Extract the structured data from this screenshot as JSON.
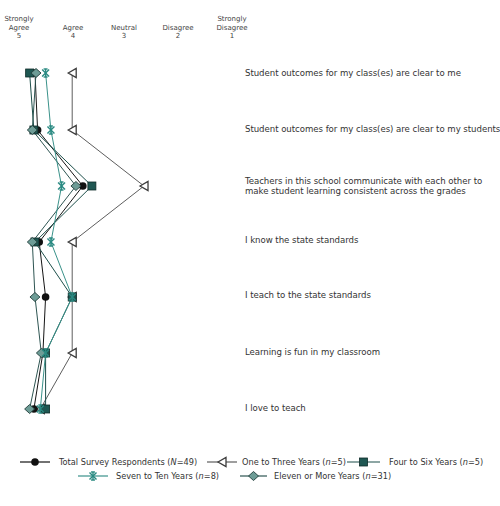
{
  "chart_data": {
    "type": "line",
    "orientation": "vertical profile (categories on rows, scale on x-axis)",
    "title": "",
    "xlabel": "",
    "ylabel": "",
    "xlim": [
      5,
      1
    ],
    "grid": false,
    "legend_position": "bottom",
    "scale_ticks": [
      {
        "value": 5,
        "label": "Strongly Agree"
      },
      {
        "value": 4,
        "label": "Agree"
      },
      {
        "value": 3,
        "label": "Neutral"
      },
      {
        "value": 2,
        "label": "Disagree"
      },
      {
        "value": 1,
        "label": "Strongly Disagree"
      }
    ],
    "categories": [
      "Student outcomes for my class(es) are clear to me",
      "Student outcomes for my class(es) are clear to my students",
      "Teachers in this school communicate with each other to make student learning consistent across the grades",
      "I know the state standards",
      "I teach to the state standards",
      "Learning is fun in my classroom",
      "I love to teach"
    ],
    "series": [
      {
        "name": "One to Three Years (n=5)",
        "marker": "triangle",
        "color": "#5a5a5a",
        "values": [
          4.0,
          4.0,
          2.65,
          4.0,
          4.0,
          4.0,
          4.6
        ]
      },
      {
        "name": "Total Survey Respondents (N=49)",
        "marker": "circle",
        "color": "#111111",
        "values": [
          4.7,
          4.65,
          3.8,
          4.62,
          4.5,
          4.55,
          4.72
        ]
      },
      {
        "name": "Four to Six Years (n=5)",
        "marker": "square",
        "color": "#1d524d",
        "values": [
          4.8,
          4.72,
          3.63,
          4.7,
          4.0,
          4.5,
          4.5
        ]
      },
      {
        "name": "Eleven or More Years (n=31)",
        "marker": "diamond",
        "color": "#2d5a56",
        "values": [
          4.68,
          4.75,
          3.93,
          4.75,
          4.7,
          4.58,
          4.8
        ]
      },
      {
        "name": "Seven to Ten Years (n=8)",
        "marker": "star",
        "color": "#2f8c84",
        "values": [
          4.5,
          4.4,
          4.2,
          4.4,
          4.0,
          4.5,
          4.6
        ]
      }
    ]
  },
  "axis": {
    "ticks": [
      {
        "line1": "Strongly",
        "line2": "Agree",
        "num": "5",
        "x": 19
      },
      {
        "line1": "",
        "line2": "Agree",
        "num": "4",
        "x": 73
      },
      {
        "line1": "",
        "line2": "Neutral",
        "num": "3",
        "x": 124
      },
      {
        "line1": "",
        "line2": "Disagree",
        "num": "2",
        "x": 178
      },
      {
        "line1": "Strongly",
        "line2": "Disagree",
        "num": "1",
        "x": 232
      }
    ]
  },
  "statements": [
    {
      "line1": "Student outcomes for my class(es) are clear to me",
      "line2": ""
    },
    {
      "line1": "Student outcomes for my class(es) are clear to my students",
      "line2": ""
    },
    {
      "line1": "Teachers in this school communicate with each other to",
      "line2": "make student learning consistent across the grades"
    },
    {
      "line1": "I know the state standards",
      "line2": ""
    },
    {
      "line1": "I teach to the state standards",
      "line2": ""
    },
    {
      "line1": "Learning is fun in my classroom",
      "line2": ""
    },
    {
      "line1": "I love to teach",
      "line2": ""
    }
  ],
  "legend": [
    {
      "prefix": "Total Survey Respondents (",
      "var": "N",
      "suffix": "=49)",
      "marker": "circle"
    },
    {
      "prefix": "One to Three Years (",
      "var": "n",
      "suffix": "=5)",
      "marker": "triangle"
    },
    {
      "prefix": "Four to Six Years (",
      "var": "n",
      "suffix": "=5)",
      "marker": "square"
    },
    {
      "prefix": "Seven to Ten Years (",
      "var": "n",
      "suffix": "=8)",
      "marker": "star"
    },
    {
      "prefix": "Eleven or More Years (",
      "var": "n",
      "suffix": "=31)",
      "marker": "diamond"
    }
  ]
}
